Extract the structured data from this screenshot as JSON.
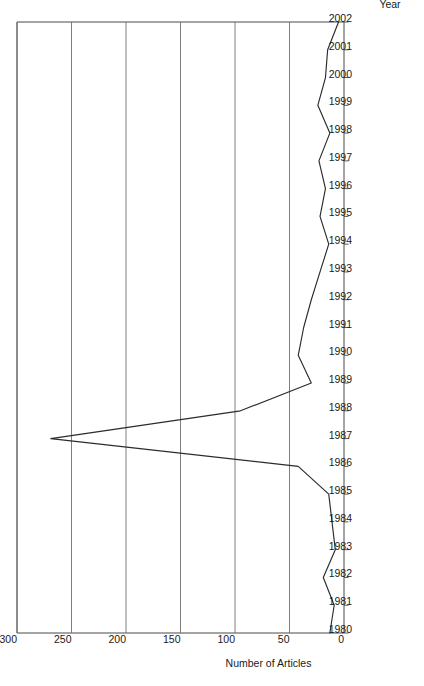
{
  "figure": {
    "orientation_note": "rotated-90-ccw",
    "background_color": "#ffffff",
    "line_color": "#2b2b2b",
    "grid_color": "#6f6f6f",
    "frame_color": "#4a4a4a"
  },
  "chart_data": {
    "type": "line",
    "title": "",
    "xlabel": "Year",
    "ylabel": "Number of Articles",
    "xlim": [
      1980,
      2002
    ],
    "ylim": [
      0,
      300
    ],
    "grid": true,
    "legend": "none",
    "x_tick_labels": [
      "1980",
      "1981",
      "1982",
      "1983",
      "1984",
      "1985",
      "1986",
      "1987",
      "1988",
      "1989",
      "1990",
      "1991",
      "1992",
      "1993",
      "1994",
      "1995",
      "1996",
      "1997",
      "1998",
      "1999",
      "2000",
      "2001",
      "2002"
    ],
    "y_tick_labels": [
      "0",
      "50",
      "100",
      "150",
      "200",
      "250",
      "300"
    ],
    "y_ticks": [
      0,
      50,
      100,
      150,
      200,
      250,
      300
    ],
    "categories": [
      1980,
      1981,
      1982,
      1983,
      1984,
      1985,
      1986,
      1987,
      1988,
      1989,
      1990,
      1991,
      1992,
      1993,
      1994,
      1995,
      1996,
      1997,
      1998,
      1999,
      2000,
      2001,
      2002
    ],
    "values": [
      13,
      9,
      19,
      8,
      11,
      14,
      42,
      269,
      95,
      30,
      42,
      37,
      30,
      22,
      14,
      22,
      17,
      23,
      13,
      24,
      17,
      15,
      5
    ],
    "series": [
      {
        "name": "Number of Articles",
        "values": [
          13,
          9,
          19,
          8,
          11,
          14,
          42,
          269,
          95,
          30,
          42,
          37,
          30,
          22,
          14,
          22,
          17,
          23,
          13,
          24,
          17,
          15,
          5
        ]
      }
    ]
  }
}
